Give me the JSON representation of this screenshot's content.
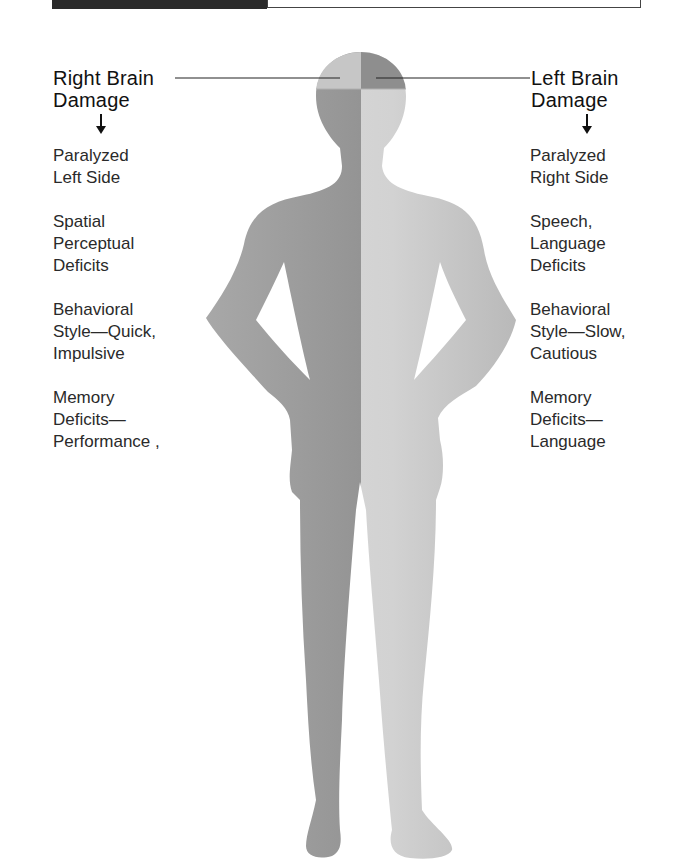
{
  "top_bar": {
    "dark_block_color": "#2b2b2b"
  },
  "left_panel": {
    "heading_line1": "Right Brain",
    "heading_line2": "Damage",
    "items": [
      {
        "lines": [
          "Paralyzed",
          "Left Side"
        ]
      },
      {
        "lines": [
          "Spatial",
          "Perceptual",
          "Deficits"
        ]
      },
      {
        "lines": [
          "Behavioral",
          "Style—Quick,",
          "Impulsive"
        ]
      },
      {
        "lines": [
          "Memory",
          "Deficits—",
          "Performance ,"
        ]
      }
    ]
  },
  "right_panel": {
    "heading_line1": "Left Brain",
    "heading_line2": "Damage",
    "items": [
      {
        "lines": [
          "Paralyzed",
          "Right Side"
        ]
      },
      {
        "lines": [
          "Speech,",
          "Language",
          "Deficits"
        ]
      },
      {
        "lines": [
          "Behavioral",
          "Style—Slow,",
          "Cautious"
        ]
      },
      {
        "lines": [
          "Memory",
          "Deficits—",
          "Language"
        ]
      }
    ]
  },
  "figure": {
    "left_half_color": "#8f8f8f",
    "right_half_color": "#cfcfcf",
    "head_top_left_color": "#c4c4c4",
    "head_top_right_color": "#8a8a8a"
  }
}
